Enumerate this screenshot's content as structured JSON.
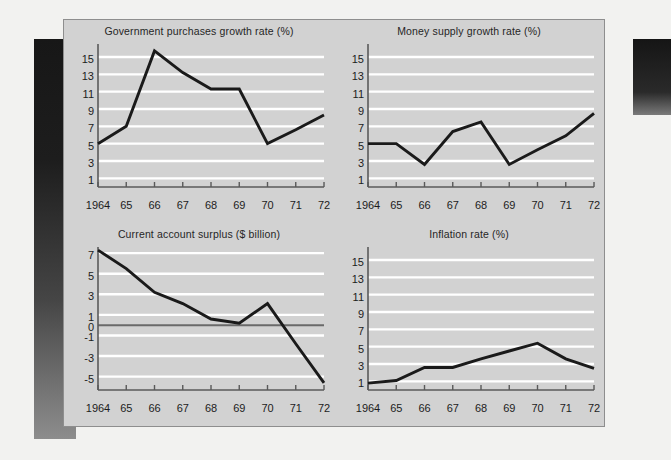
{
  "figure": {
    "background_color": "#d2d2d2",
    "page_color": "#f2f2f0",
    "line_color": "#1a1a1a",
    "gridline_color": "#ffffff",
    "axis_color": "#5a5a5a",
    "zero_line_color": "#6a6a6a"
  },
  "chart_data": [
    {
      "id": "government-purchases",
      "type": "line",
      "title": "Government purchases growth rate (%)",
      "xlabel": "",
      "ylabel": "",
      "x": [
        1964,
        1965,
        1966,
        1967,
        1968,
        1969,
        1970,
        1971,
        1972
      ],
      "xtick_labels": [
        "1964",
        "65",
        "66",
        "67",
        "68",
        "69",
        "70",
        "71",
        "72"
      ],
      "ytick_labels": [
        "1",
        "3",
        "5",
        "7",
        "9",
        "11",
        "13",
        "15"
      ],
      "yticks": [
        1,
        3,
        5,
        7,
        9,
        11,
        13,
        15
      ],
      "ylim": [
        0,
        16.5
      ],
      "xlim": [
        1964,
        1972
      ],
      "values": [
        5.0,
        7.0,
        15.7,
        13.2,
        11.3,
        11.3,
        5.0,
        6.6,
        8.3
      ],
      "grid": true,
      "legend": null
    },
    {
      "id": "money-supply",
      "type": "line",
      "title": "Money supply growth rate (%)",
      "xlabel": "",
      "ylabel": "",
      "x": [
        1964,
        1965,
        1966,
        1967,
        1968,
        1969,
        1970,
        1971,
        1972
      ],
      "xtick_labels": [
        "1964",
        "65",
        "66",
        "67",
        "68",
        "69",
        "70",
        "71",
        "72"
      ],
      "ytick_labels": [
        "1",
        "3",
        "5",
        "7",
        "9",
        "11",
        "13",
        "15"
      ],
      "yticks": [
        1,
        3,
        5,
        7,
        9,
        11,
        13,
        15
      ],
      "ylim": [
        0,
        16.5
      ],
      "xlim": [
        1964,
        1972
      ],
      "values": [
        5.0,
        5.0,
        2.6,
        6.4,
        7.5,
        2.6,
        4.3,
        5.9,
        8.5
      ],
      "grid": true,
      "legend": null
    },
    {
      "id": "current-account-surplus",
      "type": "line",
      "title": "Current account surplus ($ billion)",
      "xlabel": "",
      "ylabel": "",
      "x": [
        1964,
        1965,
        1966,
        1967,
        1968,
        1969,
        1970,
        1971,
        1972
      ],
      "xtick_labels": [
        "1964",
        "65",
        "66",
        "67",
        "68",
        "69",
        "70",
        "71",
        "72"
      ],
      "ytick_labels": [
        "-5",
        "-3",
        "-1",
        "0",
        "1",
        "3",
        "5",
        "7"
      ],
      "yticks": [
        -5,
        -3,
        -1,
        0,
        1,
        3,
        5,
        7
      ],
      "ylim": [
        -6.3,
        7.6
      ],
      "xlim": [
        1964,
        1972
      ],
      "values": [
        7.3,
        5.5,
        3.2,
        2.1,
        0.6,
        0.2,
        2.1,
        -1.8,
        -5.6
      ],
      "grid": true,
      "zero_line": 0,
      "legend": null
    },
    {
      "id": "inflation-rate",
      "type": "line",
      "title": "Inflation rate (%)",
      "xlabel": "",
      "ylabel": "",
      "x": [
        1964,
        1965,
        1966,
        1967,
        1968,
        1969,
        1970,
        1971,
        1972
      ],
      "xtick_labels": [
        "1964",
        "65",
        "66",
        "67",
        "68",
        "69",
        "70",
        "71",
        "72"
      ],
      "ytick_labels": [
        "1",
        "3",
        "5",
        "7",
        "9",
        "11",
        "13",
        "15"
      ],
      "yticks": [
        1,
        3,
        5,
        7,
        9,
        11,
        13,
        15
      ],
      "ylim": [
        0,
        16.5
      ],
      "xlim": [
        1964,
        1972
      ],
      "values": [
        0.8,
        1.1,
        2.6,
        2.6,
        3.6,
        4.5,
        5.4,
        3.6,
        2.5
      ],
      "grid": true,
      "legend": null
    }
  ]
}
